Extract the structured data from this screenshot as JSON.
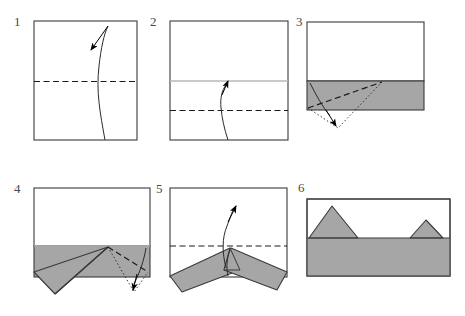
{
  "figure": {
    "kind": "origami-fold-instruction-diagram",
    "panel_count": 6,
    "colors": {
      "paper_front": "#ffffff",
      "paper_back": "#a6a6a6",
      "outline": "#3a3a3a",
      "soft_crease": "#b9b9b9",
      "fold_line": "#1a1a1a",
      "arrow": "#000000",
      "label": "#4a4a4a",
      "background": "#ffffff"
    },
    "panels": [
      {
        "id": "panel-1",
        "number": "1",
        "shape": "square",
        "description": "Square sheet with horizontal dashed valley crease at mid-height and a curved arrow sweeping upward indicating fold bottom edge to top edge.",
        "lines": [
          {
            "name": "mid-crease",
            "style": "dashed",
            "orientation": "horizontal",
            "position": "middle"
          }
        ],
        "arrows": [
          {
            "name": "fold-up-arrow",
            "style": "curved-solid",
            "direction": "up-left"
          }
        ]
      },
      {
        "id": "panel-2",
        "number": "2",
        "shape": "square",
        "description": "Square with light gray existing crease at mid-height and a new dashed valley crease at three-quarter height; curved arrow folds the bottom edge up to the mid crease.",
        "lines": [
          {
            "name": "existing-crease",
            "style": "solid-gray",
            "orientation": "horizontal",
            "position": "middle"
          },
          {
            "name": "quarter-crease",
            "style": "dashed",
            "orientation": "horizontal",
            "position": "three-quarter"
          }
        ],
        "arrows": [
          {
            "name": "fold-up-arrow",
            "style": "curved-solid",
            "direction": "up"
          }
        ]
      },
      {
        "id": "panel-3",
        "number": "3",
        "shape": "rectangle",
        "description": "Rectangle with white upper region and gray folded band along the bottom; a dashed diagonal crease runs from the lower-left corner up to the right, with dotted guide lines showing the resulting flap swung down, plus a curved arrow pointing down.",
        "lines": [
          {
            "name": "band-top-edge",
            "style": "solid",
            "orientation": "horizontal"
          },
          {
            "name": "diagonal-crease",
            "style": "dashed",
            "orientation": "diagonal"
          },
          {
            "name": "guide-lines",
            "style": "dotted",
            "orientation": "diagonal"
          }
        ],
        "arrows": [
          {
            "name": "fold-down-arrow",
            "style": "curved-solid",
            "direction": "down"
          }
        ],
        "regions": [
          {
            "name": "gray-band",
            "fill": "paper_back"
          }
        ]
      },
      {
        "id": "panel-4",
        "number": "4",
        "shape": "rectangle",
        "description": "Rectangle showing the left flap already swung out as a long gray point below the lower-left; on the right a dashed diagonal crease and dotted guide lines with a curved downward arrow indicate the mirrored fold.",
        "lines": [
          {
            "name": "existing-crease",
            "style": "solid-gray",
            "orientation": "horizontal"
          },
          {
            "name": "diagonal-crease",
            "style": "dashed",
            "orientation": "diagonal"
          },
          {
            "name": "guide-lines",
            "style": "dotted",
            "orientation": "diagonal"
          }
        ],
        "arrows": [
          {
            "name": "fold-down-arrow",
            "style": "curved-solid",
            "direction": "down"
          }
        ],
        "regions": [
          {
            "name": "left-flap",
            "fill": "paper_back"
          },
          {
            "name": "gray-band",
            "fill": "paper_back"
          }
        ]
      },
      {
        "id": "panel-5",
        "number": "5",
        "shape": "rectangle",
        "description": "Both flaps spread outward like wings from a central apex; a horizontal dashed crease crosses at mid-height and a curved arrow points upward to fold the model up.",
        "lines": [
          {
            "name": "mid-crease",
            "style": "dashed",
            "orientation": "horizontal",
            "position": "middle"
          }
        ],
        "arrows": [
          {
            "name": "fold-up-arrow",
            "style": "curved-solid",
            "direction": "up"
          }
        ],
        "regions": [
          {
            "name": "left-wing",
            "fill": "paper_back"
          },
          {
            "name": "right-wing",
            "fill": "paper_back"
          }
        ]
      },
      {
        "id": "panel-6",
        "number": "6",
        "shape": "rectangle",
        "description": "Finished result: a rectangle whose lower half is gray with two gray triangular peaks rising above the horizontal edge — a large peak left of center and a smaller peak to the right.",
        "lines": [
          {
            "name": "horizon-edge",
            "style": "solid",
            "orientation": "horizontal"
          }
        ],
        "arrows": [],
        "regions": [
          {
            "name": "gray-base",
            "fill": "paper_back"
          },
          {
            "name": "large-peak",
            "fill": "paper_back"
          },
          {
            "name": "small-peak",
            "fill": "paper_back"
          }
        ]
      }
    ]
  }
}
